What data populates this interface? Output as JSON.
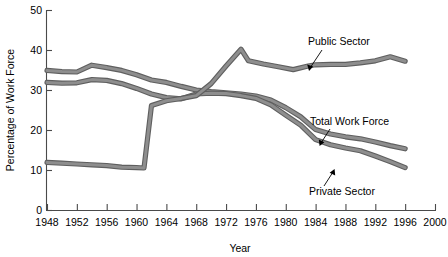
{
  "chart_data": {
    "type": "line",
    "title": "",
    "xlabel": "Year",
    "ylabel": "Percentage of Work Force",
    "xlim": [
      1948,
      2000
    ],
    "ylim": [
      0,
      50
    ],
    "xticks": [
      1948,
      1952,
      1956,
      1960,
      1964,
      1968,
      1972,
      1976,
      1980,
      1984,
      1988,
      1992,
      1996,
      2000
    ],
    "yticks": [
      0,
      10,
      20,
      30,
      40,
      50
    ],
    "grid": false,
    "legend_position": "inline-annotations",
    "series": [
      {
        "name": "Total Work Force",
        "x": [
          1948,
          1950,
          1952,
          1954,
          1956,
          1958,
          1960,
          1962,
          1964,
          1966,
          1968,
          1970,
          1972,
          1974,
          1976,
          1978,
          1980,
          1982,
          1984,
          1986,
          1988,
          1990,
          1992,
          1994,
          1996
        ],
        "values": [
          34.9,
          34.6,
          34.5,
          36.2,
          35.6,
          34.9,
          33.8,
          32.5,
          31.9,
          30.9,
          30.0,
          29.6,
          29.3,
          29.0,
          28.5,
          27.5,
          25.6,
          23.3,
          20.1,
          19.0,
          18.3,
          17.8,
          17.0,
          16.1,
          15.3
        ]
      },
      {
        "name": "Private Sector",
        "x": [
          1948,
          1950,
          1952,
          1954,
          1956,
          1958,
          1960,
          1962,
          1964,
          1966,
          1968,
          1970,
          1972,
          1974,
          1976,
          1978,
          1980,
          1982,
          1984,
          1986,
          1988,
          1990,
          1992,
          1994,
          1996
        ],
        "values": [
          31.9,
          31.7,
          31.8,
          32.6,
          32.4,
          31.6,
          30.4,
          29.0,
          28.1,
          27.8,
          29.0,
          29.2,
          29.1,
          28.6,
          27.9,
          26.3,
          23.7,
          21.2,
          17.6,
          16.3,
          15.5,
          14.8,
          13.5,
          12.1,
          10.6
        ]
      },
      {
        "name": "Public Sector",
        "x": [
          1948,
          1950,
          1952,
          1954,
          1956,
          1958,
          1960,
          1961,
          1962,
          1964,
          1966,
          1968,
          1970,
          1972,
          1974,
          1975,
          1977,
          1979,
          1981,
          1983,
          1984,
          1986,
          1988,
          1990,
          1992,
          1994,
          1996
        ],
        "values": [
          11.9,
          11.7,
          11.5,
          11.3,
          11.1,
          10.7,
          10.6,
          10.5,
          26.1,
          27.3,
          27.9,
          28.6,
          31.6,
          36.0,
          40.2,
          37.3,
          36.5,
          35.8,
          35.1,
          36.0,
          36.3,
          36.4,
          36.4,
          36.8,
          37.3,
          38.3,
          37.2
        ]
      }
    ],
    "annotations": [
      {
        "text": "Public Sector",
        "target_year": 1985,
        "target_value": 36.2
      },
      {
        "text": "Total Work Force",
        "target_year": 1989,
        "target_value": 18.1
      },
      {
        "text": "Private Sector",
        "target_year": 1990,
        "target_value": 14.6
      }
    ]
  },
  "axes": {
    "y_title": "Percentage of Work Force",
    "x_title": "Year",
    "y_tick_labels": [
      "0",
      "10",
      "20",
      "30",
      "40",
      "50"
    ],
    "x_tick_labels": [
      "1948",
      "1952",
      "1956",
      "1960",
      "1964",
      "1968",
      "1972",
      "1976",
      "1980",
      "1984",
      "1988",
      "1992",
      "1996",
      "2000"
    ]
  },
  "labels": {
    "public_sector": "Public Sector",
    "total_work_force": "Total Work Force",
    "private_sector": "Private Sector"
  },
  "colors": {
    "line_outline": "#5f5f5f",
    "line_fill": "#8e8e8e",
    "axis": "#4a4a4a",
    "text": "#000000",
    "background": "#ffffff"
  }
}
